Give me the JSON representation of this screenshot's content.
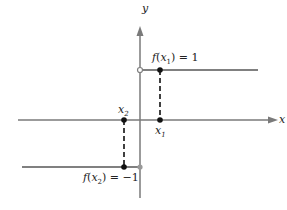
{
  "diagram": {
    "axes": {
      "x_label": "x",
      "y_label": "y"
    },
    "labels": {
      "fx1_f": "f",
      "fx1_x": "x",
      "fx1_sub": "1",
      "fx1_val": ") = 1",
      "fx2_f": "f",
      "fx2_x": "x",
      "fx2_sub": "2",
      "fx2_val": ") = −1",
      "x1": "x",
      "x1_sub": "1",
      "x2": "x",
      "x2_sub": "2"
    },
    "colors": {
      "axis": "#7a7a7a",
      "line": "#808080",
      "dot": "#111111",
      "dash": "#111111"
    }
  }
}
